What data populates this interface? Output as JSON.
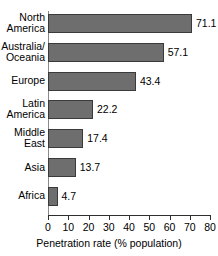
{
  "chart_data": {
    "type": "bar",
    "orientation": "horizontal",
    "title": "",
    "xlabel": "Penetration rate (% population)",
    "ylabel": "",
    "xlim": [
      0,
      80
    ],
    "xticks": [
      0,
      10,
      20,
      30,
      40,
      50,
      60,
      70,
      80
    ],
    "grid": false,
    "legend": null,
    "categories": [
      "North\nAmerica",
      "Australia/\nOceania",
      "Europe",
      "Latin\nAmerica",
      "Middle\nEast",
      "Asia",
      "Africa"
    ],
    "values": [
      71.1,
      57.1,
      43.4,
      22.2,
      17.4,
      13.7,
      4.7
    ],
    "value_labels": [
      "71.1",
      "57.1",
      "43.4",
      "22.2",
      "17.4",
      "13.7",
      "4.7"
    ],
    "bar_fill_color": "#6e6e6e",
    "bar_edge_color": "#3a3a3a",
    "axis_color": "#2e2e2e",
    "background_color": "#ffffff"
  }
}
